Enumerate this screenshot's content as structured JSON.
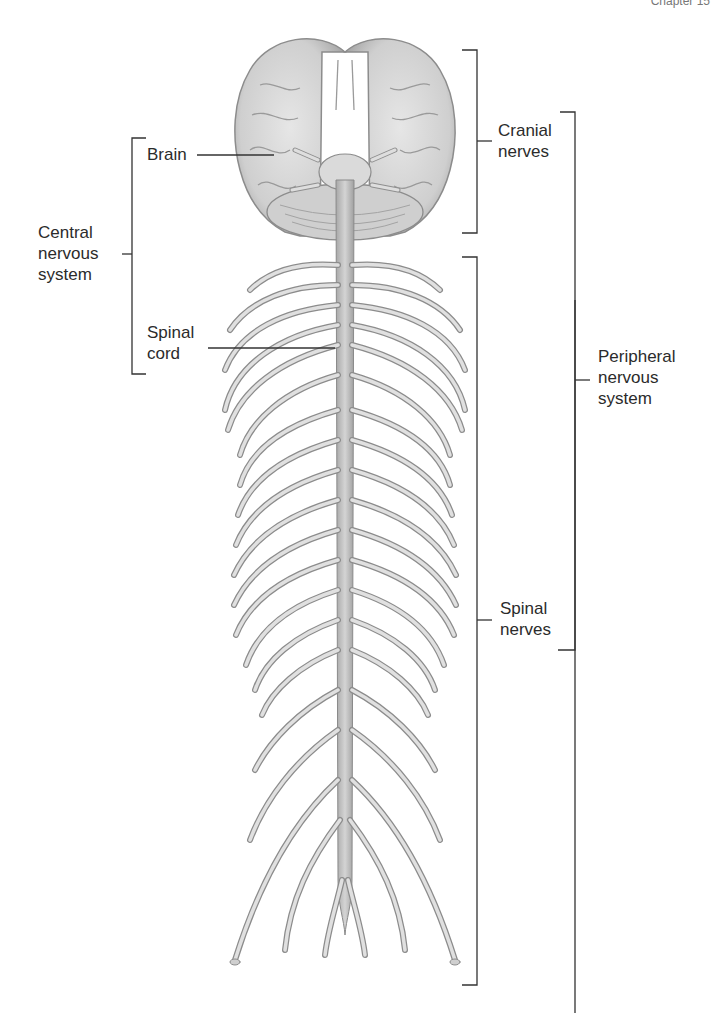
{
  "header": {
    "chapter": "Chapter 15"
  },
  "labels": {
    "brain": "Brain",
    "cns": [
      "Central",
      "nervous",
      "system"
    ],
    "spinal_cord": [
      "Spinal",
      "cord"
    ],
    "cranial_nerves": [
      "Cranial",
      "nerves"
    ],
    "pns": [
      "Peripheral",
      "nervous",
      "system"
    ],
    "spinal_nerves": [
      "Spinal",
      "nerves"
    ]
  },
  "colors": {
    "nerve_fill": "#dcdcdc",
    "nerve_stroke": "#8a8a8a",
    "brain_fill": "#d6d6d6",
    "bracket": "#333333"
  }
}
